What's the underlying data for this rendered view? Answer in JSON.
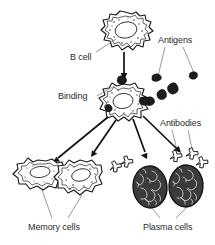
{
  "diagram": {
    "background_color": "#ffffff",
    "ink_color": "#1a1a1a",
    "leader_color": "#6e6e6e",
    "labels": {
      "b_cell": "B cell",
      "antigens": "Antigens",
      "binding": "Binding",
      "antibodies": "Antibodies",
      "memory_cells": "Memory cells",
      "plasma_cells": "Plasma cells"
    },
    "nodes": [
      {
        "id": "b-cell",
        "label": "B cell",
        "kind": "cell",
        "x": 125,
        "y": 35
      },
      {
        "id": "activated-b-cell",
        "label": "Binding",
        "kind": "cell",
        "x": 123,
        "y": 105
      },
      {
        "id": "memory-cell-1",
        "label": "Memory cells",
        "kind": "cell",
        "x": 38,
        "y": 176
      },
      {
        "id": "memory-cell-2",
        "label": "Memory cells",
        "kind": "cell",
        "x": 80,
        "y": 182
      },
      {
        "id": "plasma-cell-1",
        "label": "Plasma cells",
        "kind": "plasma",
        "x": 150,
        "y": 187
      },
      {
        "id": "plasma-cell-2",
        "label": "Plasma cells",
        "kind": "plasma",
        "x": 186,
        "y": 186
      }
    ],
    "antigen_count": 5,
    "antibody_count": 5,
    "arrow_count": 5,
    "arrows": [
      {
        "from": "b-cell",
        "to": "activated-b-cell"
      },
      {
        "from": "activated-b-cell",
        "to": "memory-cell-1"
      },
      {
        "from": "activated-b-cell",
        "to": "memory-cell-2"
      },
      {
        "from": "activated-b-cell",
        "to": "plasma-cell-1"
      },
      {
        "from": "activated-b-cell",
        "to": "plasma-cell-2"
      }
    ]
  }
}
